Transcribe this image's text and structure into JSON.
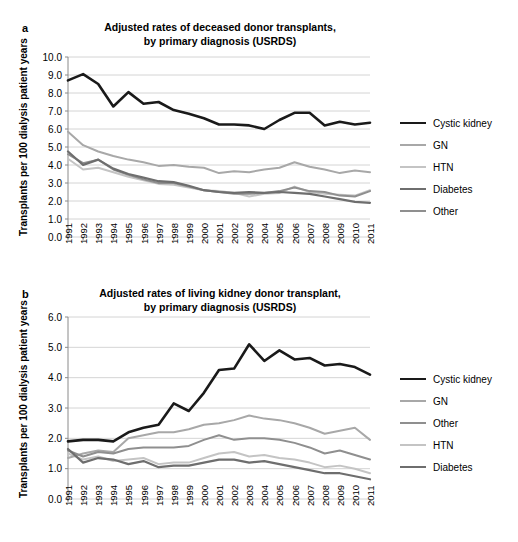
{
  "figure": {
    "ylabel": "Transplants per 100 dialysis patient years",
    "years": [
      1991,
      1992,
      1993,
      1994,
      1995,
      1996,
      1997,
      1998,
      1999,
      2000,
      2001,
      2002,
      2003,
      2004,
      2005,
      2006,
      2007,
      2008,
      2009,
      2010,
      2011
    ],
    "colors": {
      "cystic_kidney": "#1a1a1a",
      "gn": "#a8a8a8",
      "htn": "#c4c4c4",
      "diabetes": "#6e6e6e",
      "other": "#8f8f8f",
      "grid": "#c9c9c9",
      "axis": "#8a8a8a"
    }
  },
  "panel_a": {
    "letter": "a",
    "title_line1": "Adjusted rates of deceased donor transplants,",
    "title_line2": "by primary diagnosis (USRDS)",
    "ylabel": "Transplants per 100 dialysis patient years",
    "ytick_labels": [
      "0.0",
      "1.0",
      "2.0",
      "3.0",
      "4.0",
      "5.0",
      "6.0",
      "7.0",
      "8.0",
      "9.0",
      "10.0"
    ],
    "legend": [
      {
        "label": "Cystic kidney",
        "color": "#1a1a1a",
        "width": 2.6
      },
      {
        "label": "GN",
        "color": "#a8a8a8",
        "width": 2.0
      },
      {
        "label": "HTN",
        "color": "#c4c4c4",
        "width": 2.0
      },
      {
        "label": "Diabetes",
        "color": "#6e6e6e",
        "width": 2.2
      },
      {
        "label": "Other",
        "color": "#8f8f8f",
        "width": 2.0
      }
    ]
  },
  "panel_b": {
    "letter": "b",
    "title_line1": "Adjusted rates of living kidney donor transplant,",
    "title_line2": "by primary diagnosis (USRDS)",
    "ylabel": "Transplants per 100 dialysis patient years",
    "ytick_labels": [
      "0.0",
      "1.0",
      "2.0",
      "3.0",
      "4.0",
      "5.0",
      "6.0"
    ],
    "legend": [
      {
        "label": "Cystic kidney",
        "color": "#1a1a1a",
        "width": 2.6
      },
      {
        "label": "GN",
        "color": "#a8a8a8",
        "width": 2.0
      },
      {
        "label": "Other",
        "color": "#8f8f8f",
        "width": 2.0
      },
      {
        "label": "HTN",
        "color": "#c4c4c4",
        "width": 2.0
      },
      {
        "label": "Diabetes",
        "color": "#6e6e6e",
        "width": 2.2
      }
    ]
  },
  "chart_data": [
    {
      "panel": "a",
      "type": "line",
      "title": "Adjusted rates of deceased donor transplants, by primary diagnosis (USRDS)",
      "xlabel": "",
      "ylabel": "Transplants per 100 dialysis patient years",
      "x": [
        1991,
        1992,
        1993,
        1994,
        1995,
        1996,
        1997,
        1998,
        1999,
        2000,
        2001,
        2002,
        2003,
        2004,
        2005,
        2006,
        2007,
        2008,
        2009,
        2010,
        2011
      ],
      "ylim": [
        0.0,
        10.0
      ],
      "ytick_step": 1.0,
      "grid": true,
      "legend_position": "right",
      "series": [
        {
          "name": "Cystic kidney",
          "color": "#1a1a1a",
          "values": [
            8.7,
            9.05,
            8.5,
            7.25,
            8.05,
            7.4,
            7.5,
            7.05,
            6.85,
            6.6,
            6.25,
            6.25,
            6.2,
            6.0,
            6.5,
            6.9,
            6.9,
            6.2,
            6.4,
            6.25,
            6.35
          ]
        },
        {
          "name": "GN",
          "color": "#a8a8a8",
          "values": [
            5.85,
            5.1,
            4.75,
            4.5,
            4.3,
            4.15,
            3.95,
            4.0,
            3.9,
            3.85,
            3.55,
            3.65,
            3.6,
            3.75,
            3.85,
            4.15,
            3.9,
            3.75,
            3.55,
            3.7,
            3.6
          ]
        },
        {
          "name": "HTN",
          "color": "#c4c4c4",
          "values": [
            4.35,
            3.75,
            3.85,
            3.6,
            3.35,
            3.15,
            2.95,
            2.9,
            2.75,
            2.6,
            2.55,
            2.45,
            2.25,
            2.4,
            2.45,
            2.8,
            2.5,
            2.4,
            2.35,
            2.3,
            2.6
          ]
        },
        {
          "name": "Diabetes",
          "color": "#6e6e6e",
          "values": [
            4.75,
            4.0,
            4.3,
            3.8,
            3.5,
            3.3,
            3.1,
            3.05,
            2.85,
            2.6,
            2.5,
            2.45,
            2.5,
            2.45,
            2.5,
            2.45,
            2.4,
            2.25,
            2.1,
            1.95,
            1.9
          ]
        },
        {
          "name": "Other",
          "color": "#8f8f8f",
          "values": [
            4.6,
            4.1,
            4.3,
            3.75,
            3.45,
            3.2,
            3.0,
            3.0,
            2.8,
            2.6,
            2.5,
            2.4,
            2.4,
            2.45,
            2.55,
            2.75,
            2.55,
            2.5,
            2.3,
            2.25,
            2.55
          ]
        }
      ]
    },
    {
      "panel": "b",
      "type": "line",
      "title": "Adjusted rates of living kidney donor transplant, by primary diagnosis (USRDS)",
      "xlabel": "",
      "ylabel": "Transplants per 100 dialysis patient years",
      "x": [
        1991,
        1992,
        1993,
        1994,
        1995,
        1996,
        1997,
        1998,
        1999,
        2000,
        2001,
        2002,
        2003,
        2004,
        2005,
        2006,
        2007,
        2008,
        2009,
        2010,
        2011
      ],
      "ylim": [
        0.0,
        6.0
      ],
      "ytick_step": 1.0,
      "grid": true,
      "legend_position": "right",
      "series": [
        {
          "name": "Cystic kidney",
          "color": "#1a1a1a",
          "values": [
            1.9,
            1.95,
            1.95,
            1.9,
            2.2,
            2.35,
            2.45,
            3.15,
            2.9,
            3.5,
            4.25,
            4.3,
            5.1,
            4.55,
            4.9,
            4.6,
            4.65,
            4.4,
            4.45,
            4.35,
            4.1
          ]
        },
        {
          "name": "GN",
          "color": "#a8a8a8",
          "values": [
            1.35,
            1.5,
            1.6,
            1.55,
            2.0,
            2.1,
            2.2,
            2.2,
            2.3,
            2.45,
            2.5,
            2.6,
            2.75,
            2.65,
            2.6,
            2.5,
            2.35,
            2.15,
            2.25,
            2.35,
            1.95
          ]
        },
        {
          "name": "Other",
          "color": "#8f8f8f",
          "values": [
            1.6,
            1.4,
            1.55,
            1.5,
            1.65,
            1.7,
            1.7,
            1.7,
            1.75,
            1.95,
            2.1,
            1.95,
            2.0,
            2.0,
            1.95,
            1.85,
            1.7,
            1.5,
            1.6,
            1.45,
            1.3
          ]
        },
        {
          "name": "HTN",
          "color": "#c4c4c4",
          "values": [
            1.5,
            1.3,
            1.4,
            1.25,
            1.3,
            1.35,
            1.15,
            1.2,
            1.2,
            1.35,
            1.5,
            1.55,
            1.4,
            1.45,
            1.35,
            1.3,
            1.2,
            1.05,
            1.1,
            1.0,
            0.85
          ]
        },
        {
          "name": "Diabetes",
          "color": "#6e6e6e",
          "values": [
            1.65,
            1.2,
            1.35,
            1.3,
            1.15,
            1.25,
            1.05,
            1.1,
            1.1,
            1.2,
            1.3,
            1.3,
            1.2,
            1.25,
            1.15,
            1.05,
            0.95,
            0.85,
            0.85,
            0.75,
            0.65
          ]
        }
      ]
    }
  ]
}
